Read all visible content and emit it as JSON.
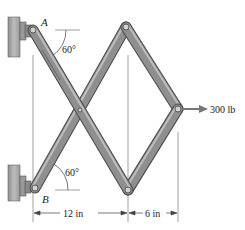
{
  "diagram": {
    "type": "mechanism-free-body",
    "labels": {
      "pin_a": "A",
      "pin_b": "B",
      "angle_top": "60°",
      "angle_bottom": "60°",
      "force": "300 lb",
      "dim_left": "12 in",
      "dim_right": "6 in"
    },
    "colors": {
      "member_fill": "#8a8a8a",
      "member_edge": "#4a4a4a",
      "member_highlight": "#b8b8b8",
      "wall": "#a9a9a9",
      "line": "#555555",
      "text": "#222222"
    },
    "nodes": {
      "A": [
        33,
        30
      ],
      "B": [
        35,
        188
      ],
      "top": [
        126,
        27
      ],
      "bottom": [
        128,
        190
      ],
      "right": [
        178,
        109
      ],
      "center": [
        80,
        110
      ]
    }
  }
}
